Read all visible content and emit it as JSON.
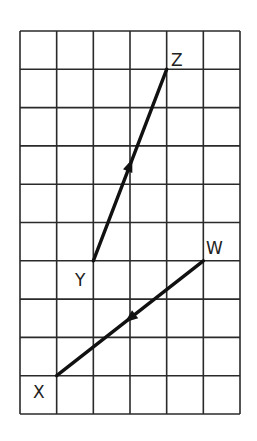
{
  "diagram": {
    "type": "grid-vectors",
    "grid": {
      "columns": 6,
      "rows": 10
    },
    "points": [
      {
        "id": "W",
        "label": "W",
        "col": 5,
        "row": 6
      },
      {
        "id": "X",
        "label": "X",
        "col": 1,
        "row": 9
      },
      {
        "id": "Y",
        "label": "Y",
        "col": 2,
        "row": 6
      },
      {
        "id": "Z",
        "label": "Z",
        "col": 4,
        "row": 1
      }
    ],
    "vectors": [
      {
        "name": "vector-YZ",
        "from": "Y",
        "to": "Z"
      },
      {
        "name": "vector-WX",
        "from": "W",
        "to": "X"
      }
    ],
    "colors": {
      "line": "#111111",
      "grid": "#2a2a2a"
    }
  }
}
